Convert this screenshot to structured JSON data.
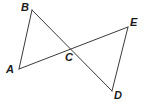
{
  "figure": {
    "background_color": "#ffffff",
    "stroke_color": "#3a3a3a",
    "stroke_width": 1,
    "label_color": "#1a1a1a",
    "width": 146,
    "height": 107,
    "points": {
      "A": {
        "name": "A",
        "x": 19,
        "y": 69,
        "label_x": 6,
        "label_y": 64
      },
      "B": {
        "name": "B",
        "x": 32,
        "y": 10,
        "label_x": 21,
        "label_y": 2
      },
      "C": {
        "name": "C",
        "x": 67,
        "y": 51,
        "label_x": 65,
        "label_y": 52
      },
      "D": {
        "name": "D",
        "x": 112,
        "y": 91,
        "label_x": 114,
        "label_y": 90
      },
      "E": {
        "name": "E",
        "x": 128,
        "y": 27,
        "label_x": 130,
        "label_y": 17
      }
    },
    "segments": [
      {
        "name": "segment-AB",
        "from": "A",
        "to": "B"
      },
      {
        "name": "segment-AE",
        "from": "A",
        "to": "E"
      },
      {
        "name": "segment-BD",
        "from": "B",
        "to": "D"
      },
      {
        "name": "segment-DE",
        "from": "D",
        "to": "E"
      }
    ],
    "labels": [
      "A",
      "B",
      "C",
      "D",
      "E"
    ]
  }
}
